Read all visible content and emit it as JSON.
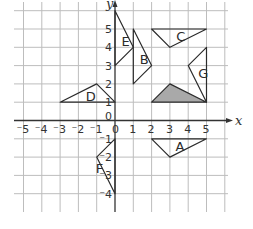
{
  "diagram": {
    "type": "coordinate-grid",
    "axes": {
      "x_label": "x",
      "y_label": "y",
      "x_ticks": [
        {
          "value": -5,
          "label": "⁻5"
        },
        {
          "value": -4,
          "label": "⁻4"
        },
        {
          "value": -3,
          "label": "⁻3"
        },
        {
          "value": -2,
          "label": "⁻2"
        },
        {
          "value": -1,
          "label": "⁻1"
        },
        {
          "value": 0,
          "label": "0"
        },
        {
          "value": 1,
          "label": "1"
        },
        {
          "value": 2,
          "label": "2"
        },
        {
          "value": 3,
          "label": "3"
        },
        {
          "value": 4,
          "label": "4"
        },
        {
          "value": 5,
          "label": "5"
        }
      ],
      "y_ticks": [
        {
          "value": 5,
          "label": "5"
        },
        {
          "value": 4,
          "label": "4"
        },
        {
          "value": 3,
          "label": "3"
        },
        {
          "value": 2,
          "label": "2"
        },
        {
          "value": 1,
          "label": "1"
        },
        {
          "value": 0,
          "label": "0"
        },
        {
          "value": -1,
          "label": "⁻1"
        },
        {
          "value": -2,
          "label": "⁻2"
        },
        {
          "value": -3,
          "label": "⁻3"
        },
        {
          "value": -4,
          "label": "⁻4"
        }
      ],
      "x_range": [
        -5.5,
        6.3
      ],
      "y_range": [
        -4.8,
        6.3
      ]
    },
    "shapes": [
      {
        "name": "shaded",
        "label": "",
        "shaded": true,
        "fill": "#a9a9a9",
        "points": [
          [
            2,
            1
          ],
          [
            5,
            1
          ],
          [
            3,
            2
          ]
        ],
        "label_at": null
      },
      {
        "name": "A",
        "label": "A",
        "shaded": false,
        "points": [
          [
            2,
            -1
          ],
          [
            5,
            -1
          ],
          [
            3,
            -2
          ]
        ],
        "label_at": [
          3.3,
          -1.4
        ]
      },
      {
        "name": "B",
        "label": "B",
        "shaded": false,
        "points": [
          [
            1,
            5
          ],
          [
            1,
            2
          ],
          [
            2,
            3
          ]
        ],
        "label_at": [
          1.35,
          3.35
        ]
      },
      {
        "name": "C",
        "label": "C",
        "shaded": false,
        "points": [
          [
            2,
            5
          ],
          [
            5,
            5
          ],
          [
            3,
            4
          ]
        ],
        "label_at": [
          3.35,
          4.6
        ]
      },
      {
        "name": "D",
        "label": "D",
        "shaded": false,
        "points": [
          [
            -3,
            1
          ],
          [
            0,
            1
          ],
          [
            -1,
            2
          ]
        ],
        "label_at": [
          -1.6,
          1.35
        ]
      },
      {
        "name": "E",
        "label": "E",
        "shaded": false,
        "points": [
          [
            0,
            6
          ],
          [
            1,
            4
          ],
          [
            0,
            3
          ]
        ],
        "label_at": [
          0.35,
          4.35
        ]
      },
      {
        "name": "F",
        "label": "F",
        "shaded": false,
        "points": [
          [
            0,
            -1
          ],
          [
            -1,
            -2
          ],
          [
            0,
            -4
          ]
        ],
        "label_at": [
          -1.05,
          -2.6
        ]
      },
      {
        "name": "G",
        "label": "G",
        "shaded": false,
        "points": [
          [
            5,
            1
          ],
          [
            5,
            4
          ],
          [
            4,
            3
          ]
        ],
        "label_at": [
          4.55,
          2.6
        ]
      }
    ]
  }
}
